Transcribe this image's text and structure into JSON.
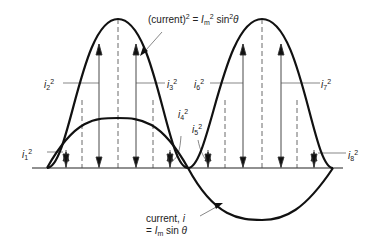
{
  "diagram": {
    "type": "waveform",
    "curves": [
      {
        "name": "current",
        "expression": "i = Im sin θ",
        "label_line1": "current, i",
        "label_line2": "= Im sin θ"
      },
      {
        "name": "current squared",
        "expression": "(current)² = Im² sin²θ"
      }
    ],
    "ordinates": [
      "i1²",
      "i2²",
      "i3²",
      "i4²",
      "i5²",
      "i6²",
      "i7²",
      "i8²"
    ]
  },
  "labels": {
    "top_eq_a": "(current)",
    "top_eq_b": "2",
    "top_eq_c": " = ",
    "top_eq_d": "I",
    "top_eq_e": "m",
    "top_eq_f": "2",
    "top_eq_g": " sin",
    "top_eq_h": "2",
    "top_eq_i": "θ",
    "i1": "i",
    "i1_sub": "1",
    "i2": "i",
    "i2_sub": "2",
    "i3": "i",
    "i3_sub": "3",
    "i4": "i",
    "i4_sub": "4",
    "i5": "i",
    "i5_sub": "5",
    "i6": "i",
    "i6_sub": "6",
    "i7": "i",
    "i7_sub": "7",
    "i8": "i",
    "i8_sub": "8",
    "sq": "2",
    "bottom_line1": "current, ",
    "bottom_i": "i",
    "bottom_line2_a": "= ",
    "bottom_line2_I": "I",
    "bottom_line2_m": "m",
    "bottom_line2_b": " sin ",
    "bottom_line2_theta": "θ"
  }
}
